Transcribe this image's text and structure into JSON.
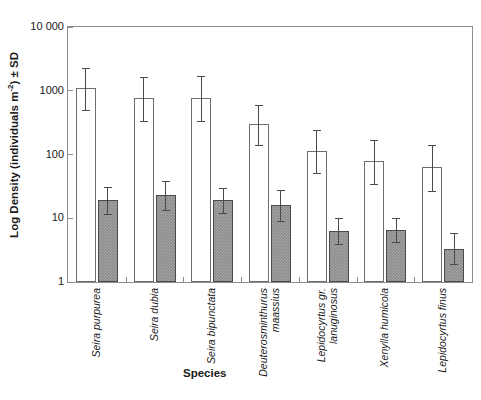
{
  "chart_data": {
    "type": "bar",
    "title": "",
    "xlabel": "Species",
    "ylabel": "Log Density (individuals m-2) ± SD",
    "ylabel_parts": {
      "pre": "Log Density (individuals m",
      "sup": "-2",
      "post": ") ± SD"
    },
    "yscale": "log",
    "ylim": [
      1,
      10000
    ],
    "ytick_labels": [
      "10 000",
      "1000",
      "100",
      "10",
      "1"
    ],
    "ytick_values": [
      10000,
      1000,
      100,
      10,
      1
    ],
    "grid": false,
    "legend": "none",
    "categories": [
      "Seira purpurea",
      "Seira dubia",
      "Seira bipunctata",
      "Deuterosminthurus maassius",
      "Lepidocyrtus gr. lanuginosus",
      "Xenylla humicola",
      "Lepidocyrtus finus"
    ],
    "category_lines": [
      [
        "Seira purpurea"
      ],
      [
        "Seira dubia"
      ],
      [
        "Seira bipunctata"
      ],
      [
        "Deuterosminthurus",
        "maassius"
      ],
      [
        "Lepidocyrtus gr.",
        "lanuginosus"
      ],
      [
        "Xenylla humicola"
      ],
      [
        "Lepidocyrtus finus"
      ]
    ],
    "series": [
      {
        "name": "open",
        "style": "white-filled-bar",
        "color": "#ffffff",
        "values": [
          1100,
          780,
          760,
          300,
          115,
          78,
          63
        ],
        "err_low": [
          500,
          340,
          330,
          140,
          52,
          34,
          27
        ],
        "err_high": [
          2300,
          1650,
          1700,
          600,
          240,
          170,
          140
        ]
      },
      {
        "name": "filled",
        "style": "grey-hatched-bar",
        "color": "#8c8c8c",
        "values": [
          19,
          23,
          19,
          16,
          6.3,
          6.5,
          3.3
        ],
        "err_low": [
          11.5,
          13.5,
          12.0,
          9.0,
          4.0,
          4.2,
          1.9
        ],
        "err_high": [
          31,
          39,
          30,
          28,
          10.0,
          10.2,
          5.8
        ]
      }
    ]
  },
  "axis": {
    "y_title": "Log Density (individuals m-2) ± SD",
    "x_title": "Species"
  }
}
